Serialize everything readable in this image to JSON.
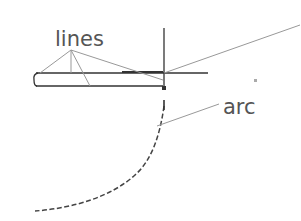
{
  "labels": {
    "lines": "lines",
    "arc": "arc"
  },
  "colors": {
    "background": "#ffffff",
    "text": "#555555",
    "drawing": "#333333",
    "leader": "#999999",
    "dot": "#aaaaaa"
  }
}
